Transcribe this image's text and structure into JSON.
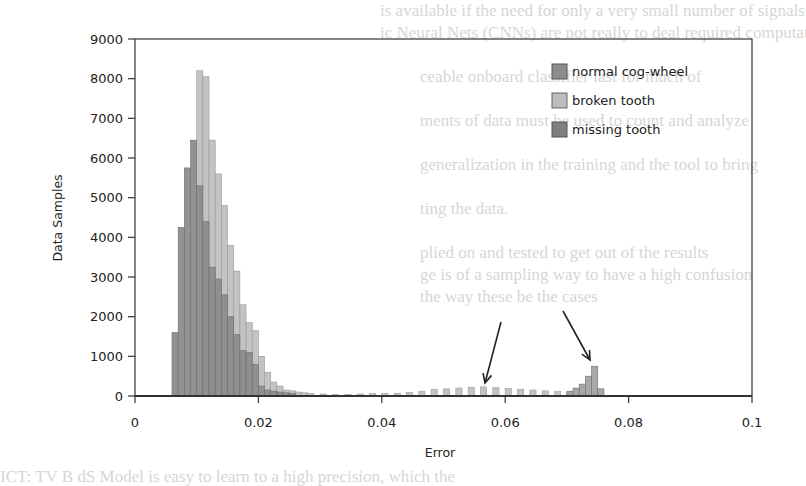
{
  "chart_data": {
    "type": "bar",
    "subtype": "overlapping-histogram",
    "title": "",
    "xlabel": "Error",
    "ylabel": "Data Samples",
    "xlim": [
      0,
      0.1
    ],
    "ylim": [
      0,
      9000
    ],
    "xticks": [
      0,
      0.02,
      0.04,
      0.06,
      0.08,
      0.1
    ],
    "xtick_labels": [
      "0",
      "0.02",
      "0.04",
      "0.06",
      "0.08",
      "0.1"
    ],
    "yticks": [
      0,
      1000,
      2000,
      3000,
      4000,
      5000,
      6000,
      7000,
      8000,
      9000
    ],
    "ytick_labels": [
      "0",
      "1000",
      "2000",
      "3000",
      "4000",
      "5000",
      "6000",
      "7000",
      "8000",
      "9000"
    ],
    "grid": false,
    "legend_position": "upper right",
    "bin_width": 0.001,
    "series": [
      {
        "name": "normal cog-wheel",
        "color": "#8c8c8c",
        "bin_starts": [
          0.006,
          0.007,
          0.008,
          0.009,
          0.01,
          0.011,
          0.012,
          0.013,
          0.014,
          0.015,
          0.016,
          0.017,
          0.018,
          0.019,
          0.02,
          0.021,
          0.022,
          0.023,
          0.024,
          0.025
        ],
        "values": [
          1600,
          4250,
          5750,
          6450,
          5300,
          4400,
          3250,
          2950,
          2550,
          2000,
          1550,
          1150,
          1100,
          800,
          250,
          150,
          120,
          100,
          80,
          60
        ]
      },
      {
        "name": "broken tooth",
        "color": "#bdbdbd",
        "bin_starts": [
          0.01,
          0.011,
          0.012,
          0.013,
          0.014,
          0.015,
          0.016,
          0.017,
          0.018,
          0.019,
          0.02,
          0.021,
          0.022,
          0.023,
          0.024,
          0.025,
          0.026,
          0.027,
          0.028,
          0.03,
          0.032,
          0.034,
          0.036,
          0.038,
          0.04,
          0.042,
          0.044,
          0.046,
          0.048,
          0.05,
          0.052,
          0.054,
          0.056,
          0.058,
          0.06,
          0.062,
          0.064,
          0.066,
          0.068,
          0.07
        ],
        "values": [
          8200,
          8050,
          6450,
          5600,
          4800,
          3800,
          3150,
          2300,
          1850,
          1650,
          1000,
          600,
          350,
          250,
          150,
          130,
          100,
          80,
          60,
          50,
          40,
          40,
          50,
          60,
          60,
          70,
          90,
          120,
          160,
          180,
          200,
          220,
          230,
          210,
          190,
          170,
          150,
          130,
          110,
          100
        ]
      },
      {
        "name": "missing tooth",
        "color": "#a3a3a3",
        "bin_starts": [
          0.07,
          0.071,
          0.072,
          0.073,
          0.074,
          0.075
        ],
        "values": [
          120,
          200,
          300,
          500,
          750,
          180
        ]
      }
    ],
    "annotations": [
      {
        "type": "arrow",
        "from": [
          0.0585,
          2100
        ],
        "to": [
          0.0565,
          250
        ],
        "label": ""
      },
      {
        "type": "arrow",
        "from": [
          0.0675,
          2200
        ],
        "to": [
          0.0735,
          800
        ],
        "label": ""
      }
    ]
  },
  "axes": {
    "xlabel": "Error",
    "ylabel": "Data Samples"
  },
  "legend": {
    "items": [
      {
        "label": "normal cog-wheel",
        "color": "#8c8c8c"
      },
      {
        "label": "broken tooth",
        "color": "#bdbdbd"
      },
      {
        "label": "missing tooth",
        "color": "#7f7f7f"
      }
    ]
  }
}
